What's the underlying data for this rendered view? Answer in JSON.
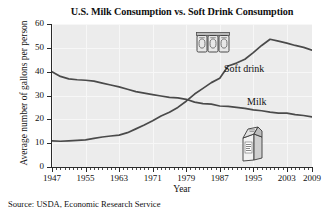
{
  "chart_data": {
    "type": "line",
    "title": "U.S. Milk Consumption vs. Soft Drink Consumption",
    "xlabel": "Year",
    "ylabel": "Average number of gallons per person",
    "xlim": [
      1947,
      2009
    ],
    "ylim": [
      0,
      60
    ],
    "ytick_labels": [
      "0",
      "10",
      "20",
      "30",
      "40",
      "50",
      "60"
    ],
    "ytick_values": [
      0,
      10,
      20,
      30,
      40,
      50,
      60
    ],
    "xtick_labels": [
      "1947",
      "1955",
      "1963",
      "1971",
      "1979",
      "1987",
      "1995",
      "2003",
      "2009"
    ],
    "xtick_values": [
      1947,
      1955,
      1963,
      1971,
      1979,
      1987,
      1995,
      2003,
      2009
    ],
    "grid": true,
    "legend": "inline-labels",
    "x": [
      1947,
      1949,
      1951,
      1953,
      1955,
      1957,
      1959,
      1961,
      1963,
      1965,
      1967,
      1969,
      1971,
      1973,
      1975,
      1977,
      1979,
      1981,
      1983,
      1985,
      1987,
      1989,
      1991,
      1993,
      1995,
      1997,
      1999,
      2001,
      2003,
      2005,
      2007,
      2009
    ],
    "series": [
      {
        "name": "Milk",
        "color": "#4a4a4a",
        "values": [
          40.0,
          38.0,
          37.0,
          36.6,
          36.4,
          36.0,
          35.2,
          34.4,
          33.6,
          32.6,
          31.6,
          31.0,
          30.4,
          29.8,
          29.2,
          29.0,
          28.4,
          27.2,
          26.6,
          26.4,
          25.6,
          25.4,
          25.0,
          24.6,
          24.0,
          23.6,
          23.0,
          22.6,
          22.6,
          22.0,
          21.6,
          21.0
        ]
      },
      {
        "name": "Soft drink",
        "color": "#4a4a4a",
        "values": [
          11.0,
          10.8,
          11.0,
          11.2,
          11.4,
          12.0,
          12.6,
          13.0,
          13.4,
          14.4,
          16.0,
          17.6,
          19.4,
          21.4,
          23.0,
          25.0,
          27.6,
          30.6,
          33.0,
          35.4,
          37.2,
          42.4,
          43.6,
          45.2,
          48.0,
          51.0,
          53.6,
          52.8,
          52.0,
          51.0,
          50.2,
          49.0
        ]
      }
    ],
    "annotations": [
      {
        "name": "soft-drink-series-label",
        "text": "Soft drink"
      },
      {
        "name": "milk-series-label",
        "text": "Milk"
      }
    ],
    "icons": [
      {
        "name": "soda-cans-icon",
        "description": "three-pack of soda cans"
      },
      {
        "name": "milk-carton-icon",
        "description": "milk carton"
      }
    ]
  },
  "source": {
    "text": "Source: USDA, Economic Research Service"
  },
  "colors": {
    "plot_background": "#ececec",
    "line": "#4a4a4a",
    "axis": "#2b2b2b",
    "grid": "#f7f7f7",
    "page_background": "#ffffff"
  }
}
